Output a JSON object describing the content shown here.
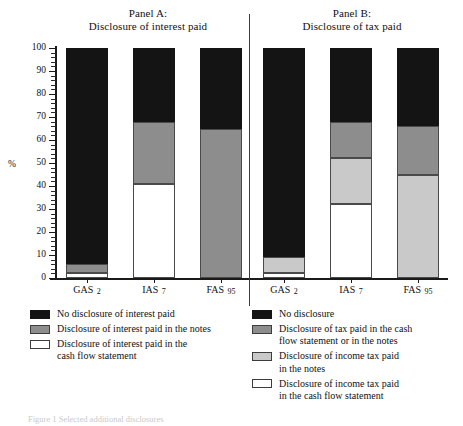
{
  "figure": {
    "y_axis_caption": "%",
    "caption": "Figure 1  Selected additional disclosures"
  },
  "panels": [
    {
      "title_line1": "Panel A:",
      "title_line2": "Disclosure of interest paid",
      "categories": [
        "GAS 2",
        "IAS 7",
        "FAS 95"
      ],
      "legend": [
        {
          "key": "black",
          "lines": [
            "No disclosure of interest paid"
          ]
        },
        {
          "key": "dgray",
          "lines": [
            "Disclosure of interest paid in the notes"
          ]
        },
        {
          "key": "white",
          "lines": [
            "Disclosure of interest paid in the",
            "cash flow statement"
          ]
        }
      ]
    },
    {
      "title_line1": "Panel B:",
      "title_line2": "Disclosure of tax paid",
      "categories": [
        "GAS 2",
        "IAS 7",
        "FAS 95"
      ],
      "legend": [
        {
          "key": "black",
          "lines": [
            "No disclosure"
          ]
        },
        {
          "key": "dgray",
          "lines": [
            "Disclosure of tax paid in the cash",
            "flow statement or in the notes"
          ]
        },
        {
          "key": "lgray",
          "lines": [
            "Disclosure of income tax paid",
            "in the notes"
          ]
        },
        {
          "key": "white",
          "lines": [
            "Disclosure of income tax paid",
            "in the cash flow statement"
          ]
        }
      ]
    }
  ],
  "chart_data": {
    "type": "bar",
    "subtype": "stacked-100-percent",
    "xlabel": "",
    "ylabel": "%",
    "ylim": [
      0,
      100
    ],
    "ytick_step": 10,
    "yminor_tick_step": 2,
    "ytick_labels": [
      "0",
      "10",
      "20",
      "30",
      "40",
      "50",
      "60",
      "70",
      "80",
      "90",
      "100"
    ],
    "grid": false,
    "legend_position": "below",
    "panels": [
      {
        "name": "Panel A: Disclosure of interest paid",
        "categories": [
          "GAS 2",
          "IAS 7",
          "FAS 95"
        ],
        "series": [
          {
            "name": "Disclosure of interest paid in the cash flow statement",
            "key": "white",
            "color": "#ffffff",
            "values": [
              2,
              41,
              0
            ]
          },
          {
            "name": "Disclosure of interest paid in the notes",
            "key": "dgray",
            "color": "#8d8d8d",
            "values": [
              4,
              27,
              65
            ]
          },
          {
            "name": "No disclosure of interest paid",
            "key": "black",
            "color": "#141414",
            "values": [
              94,
              32,
              35
            ]
          }
        ]
      },
      {
        "name": "Panel B: Disclosure of tax paid",
        "categories": [
          "GAS 2",
          "IAS 7",
          "FAS 95"
        ],
        "series": [
          {
            "name": "Disclosure of income tax paid in the cash flow statement",
            "key": "white",
            "color": "#ffffff",
            "values": [
              2,
              32,
              0
            ]
          },
          {
            "name": "Disclosure of income tax paid in the notes",
            "key": "lgray",
            "color": "#c9c9c9",
            "values": [
              7,
              20,
              45
            ]
          },
          {
            "name": "Disclosure of tax paid in the cash flow statement or in the notes",
            "key": "dgray",
            "color": "#8d8d8d",
            "values": [
              0,
              16,
              21
            ]
          },
          {
            "name": "No disclosure",
            "key": "black",
            "color": "#141414",
            "values": [
              91,
              32,
              34
            ]
          }
        ]
      }
    ]
  }
}
